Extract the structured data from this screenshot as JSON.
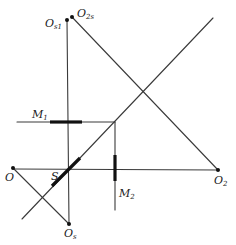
{
  "diagram": {
    "colors": {
      "line": "#3a3a3a",
      "thick": "#111111",
      "background": "#ffffff"
    },
    "labels": {
      "os1": {
        "main": "O",
        "sub": "s1"
      },
      "o2s": {
        "main": "O",
        "sub": "2s"
      },
      "m1": {
        "main": "M",
        "sub": "1"
      },
      "m2": {
        "main": "M",
        "sub": "2"
      },
      "o": {
        "main": "O"
      },
      "s": {
        "main": "S"
      },
      "o2": {
        "main": "O",
        "sub": "2"
      },
      "os": {
        "main": "O",
        "sub": "s"
      }
    },
    "points": {
      "O": [
        13,
        168
      ],
      "O_s": [
        69,
        224
      ],
      "O_s1": [
        67,
        20
      ],
      "O_2s": [
        72,
        17
      ],
      "O_2": [
        218,
        170
      ],
      "M1_corner": [
        115,
        122
      ],
      "S_center": [
        68,
        170
      ]
    }
  }
}
